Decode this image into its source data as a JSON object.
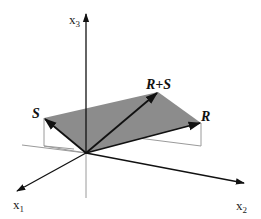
{
  "diagram": {
    "type": "3d-vector-addition",
    "axes": {
      "x1": {
        "label": "x",
        "subscript": "1"
      },
      "x2": {
        "label": "x",
        "subscript": "2"
      },
      "x3": {
        "label": "x",
        "subscript": "3"
      }
    },
    "vectors": {
      "R": {
        "label": "R"
      },
      "S": {
        "label": "S"
      },
      "R_plus_S": {
        "label": "R+S"
      }
    },
    "colors": {
      "parallelogram_fill": "#8c8c8c",
      "vector_stroke": "#111111",
      "axis_stroke": "#111111",
      "projection_stroke": "#9a9a9a",
      "background": "#ffffff"
    }
  }
}
